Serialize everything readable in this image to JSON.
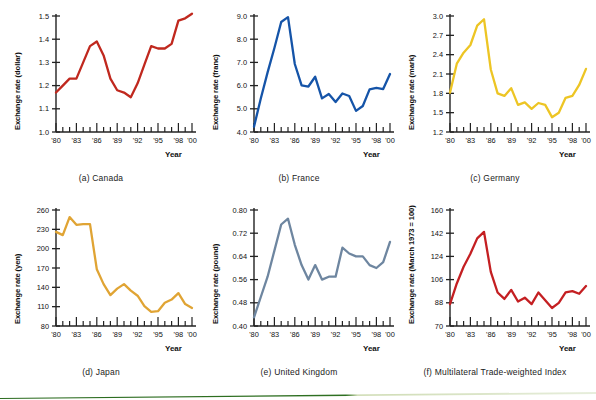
{
  "figure": {
    "title_visible": false,
    "bottom_rule": {
      "name": "green-rule",
      "left_color": "#2b6b1f",
      "right_color": "#dfe6c9"
    }
  },
  "axis_common": {
    "x_label": "Year",
    "x_tick_labels": [
      "'80",
      "'83",
      "'86",
      "'89",
      "'92",
      "'95",
      "'98",
      "'00"
    ],
    "x_tick_years": [
      1980,
      1983,
      1986,
      1989,
      1992,
      1995,
      1998,
      2000
    ],
    "x_range": [
      1980,
      2000
    ]
  },
  "chart_data": [
    {
      "id": "canada",
      "type": "line",
      "caption": "(a) Canada",
      "title": "",
      "ylabel": "Exchange rate (dollar)",
      "xlabel": "Year",
      "color": "#c0281e",
      "ylim": [
        1.0,
        1.5
      ],
      "yticks": [
        1.0,
        1.1,
        1.2,
        1.3,
        1.4,
        1.5
      ],
      "ytick_labels": [
        "1.0",
        "1.1",
        "1.2",
        "1.3",
        "1.4",
        "1.5"
      ],
      "x": [
        1980,
        1981,
        1982,
        1983,
        1984,
        1985,
        1986,
        1987,
        1988,
        1989,
        1990,
        1991,
        1992,
        1993,
        1994,
        1995,
        1996,
        1997,
        1998,
        1999,
        2000
      ],
      "values": [
        1.17,
        1.2,
        1.23,
        1.23,
        1.3,
        1.37,
        1.39,
        1.33,
        1.23,
        1.18,
        1.17,
        1.15,
        1.21,
        1.29,
        1.37,
        1.36,
        1.36,
        1.38,
        1.48,
        1.49,
        1.51
      ],
      "grid": false,
      "legend": "none"
    },
    {
      "id": "france",
      "type": "line",
      "caption": "(b) France",
      "title": "",
      "ylabel": "Exchange rate (franc)",
      "xlabel": "Year",
      "color": "#1554a8",
      "ylim": [
        4.0,
        9.0
      ],
      "yticks": [
        4.0,
        5.0,
        6.0,
        7.0,
        8.0,
        9.0
      ],
      "ytick_labels": [
        "4.0",
        "5.0",
        "6.0",
        "7.0",
        "8.0",
        "9.0"
      ],
      "x": [
        1980,
        1981,
        1982,
        1983,
        1984,
        1985,
        1986,
        1987,
        1988,
        1989,
        1990,
        1991,
        1992,
        1993,
        1994,
        1995,
        1996,
        1997,
        1998,
        1999,
        2000
      ],
      "values": [
        4.23,
        5.44,
        6.57,
        7.62,
        8.74,
        8.95,
        6.93,
        6.01,
        5.96,
        6.38,
        5.45,
        5.64,
        5.29,
        5.66,
        5.55,
        4.91,
        5.12,
        5.84,
        5.9,
        5.85,
        6.5
      ],
      "grid": false,
      "legend": "none"
    },
    {
      "id": "germany",
      "type": "line",
      "caption": "(c) Germany",
      "title": "",
      "ylabel": "Exchange rate (mark)",
      "xlabel": "Year",
      "color": "#edc524",
      "ylim": [
        1.2,
        3.0
      ],
      "yticks": [
        1.2,
        1.5,
        1.8,
        2.1,
        2.4,
        2.7,
        3.0
      ],
      "ytick_labels": [
        "1.2",
        "1.5",
        "1.8",
        "2.1",
        "2.4",
        "2.7",
        "3.0"
      ],
      "x": [
        1980,
        1981,
        1982,
        1983,
        1984,
        1985,
        1986,
        1987,
        1988,
        1989,
        1990,
        1991,
        1992,
        1993,
        1994,
        1995,
        1996,
        1997,
        1998,
        1999,
        2000
      ],
      "values": [
        1.81,
        2.26,
        2.43,
        2.55,
        2.85,
        2.95,
        2.17,
        1.8,
        1.76,
        1.88,
        1.62,
        1.66,
        1.56,
        1.65,
        1.62,
        1.43,
        1.5,
        1.73,
        1.76,
        1.93,
        2.18
      ],
      "grid": false,
      "legend": "none"
    },
    {
      "id": "japan",
      "type": "line",
      "caption": "(d) Japan",
      "title": "",
      "ylabel": "Exchange rate (yen)",
      "xlabel": "Year",
      "color": "#e0a434",
      "ylim": [
        80,
        260
      ],
      "yticks": [
        80,
        110,
        140,
        170,
        200,
        230,
        260
      ],
      "ytick_labels": [
        "80",
        "110",
        "140",
        "170",
        "200",
        "230",
        "260"
      ],
      "x": [
        1980,
        1981,
        1982,
        1983,
        1984,
        1985,
        1986,
        1987,
        1988,
        1989,
        1990,
        1991,
        1992,
        1993,
        1994,
        1995,
        1996,
        1997,
        1998,
        1999,
        2000
      ],
      "values": [
        226,
        221,
        249,
        237,
        238,
        238,
        168,
        145,
        128,
        138,
        145,
        135,
        127,
        111,
        102,
        103,
        116,
        121,
        131,
        114,
        108
      ],
      "grid": false,
      "legend": "none"
    },
    {
      "id": "united-kingdom",
      "type": "line",
      "caption": "(e) United Kingdom",
      "title": "",
      "ylabel": "Exchange rate (pound)",
      "xlabel": "Year",
      "color": "#6e86a0",
      "ylim": [
        0.4,
        0.8
      ],
      "yticks": [
        0.4,
        0.48,
        0.56,
        0.64,
        0.72,
        0.8
      ],
      "ytick_labels": [
        "0.40",
        "0.48",
        "0.56",
        "0.64",
        "0.72",
        "0.80"
      ],
      "x": [
        1980,
        1981,
        1982,
        1983,
        1984,
        1985,
        1986,
        1987,
        1988,
        1989,
        1990,
        1991,
        1992,
        1993,
        1994,
        1995,
        1996,
        1997,
        1998,
        1999,
        2000
      ],
      "values": [
        0.43,
        0.5,
        0.57,
        0.66,
        0.75,
        0.77,
        0.68,
        0.61,
        0.56,
        0.61,
        0.56,
        0.57,
        0.57,
        0.67,
        0.65,
        0.64,
        0.64,
        0.61,
        0.6,
        0.62,
        0.69
      ],
      "grid": false,
      "legend": "none"
    },
    {
      "id": "multilateral-trade-weighted-index",
      "type": "line",
      "caption": "(f) Multilateral Trade-weighted Index",
      "title": "",
      "ylabel": "Exchange rate (March 1973 = 100)",
      "xlabel": "Year",
      "color": "#c41f22",
      "ylim": [
        70,
        160
      ],
      "yticks": [
        70,
        88,
        106,
        124,
        142,
        160
      ],
      "ytick_labels": [
        "70",
        "88",
        "106",
        "124",
        "142",
        "160"
      ],
      "x": [
        1980,
        1981,
        1982,
        1983,
        1984,
        1985,
        1986,
        1987,
        1988,
        1989,
        1990,
        1991,
        1992,
        1993,
        1994,
        1995,
        1996,
        1997,
        1998,
        1999,
        2000
      ],
      "values": [
        87,
        103,
        116,
        126,
        138,
        143,
        112,
        96,
        91,
        98,
        89,
        92,
        87,
        96,
        90,
        84,
        88,
        96,
        97,
        95,
        101
      ],
      "grid": false,
      "legend": "none"
    }
  ]
}
